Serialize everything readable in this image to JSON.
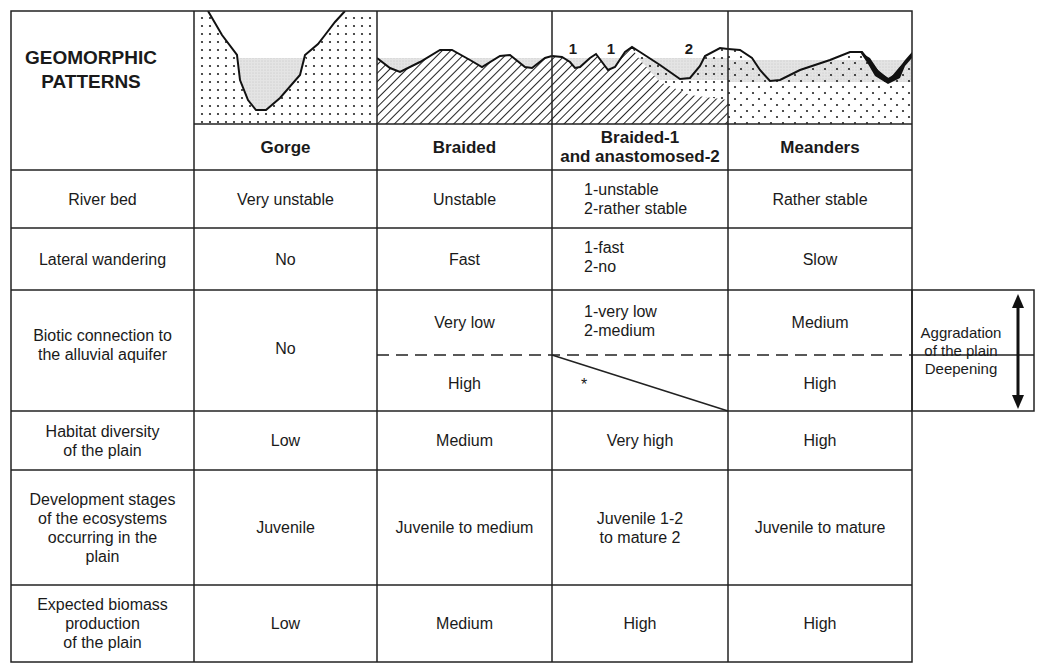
{
  "title": "GEOMORPHIC\nPATTERNS",
  "columns": [
    {
      "label": "Gorge"
    },
    {
      "label": "Braided"
    },
    {
      "label": "Braided-1\nand anastomosed-2"
    },
    {
      "label": "Meanders"
    }
  ],
  "diagram_labels": {
    "braid_1a": "1",
    "braid_1b": "1",
    "anast_2": "2"
  },
  "rows": {
    "river_bed": {
      "label": "River bed",
      "gorge": "Very unstable",
      "braided": "Unstable",
      "mixed": "1-unstable\n2-rather stable",
      "meanders": "Rather stable"
    },
    "lateral": {
      "label": "Lateral wandering",
      "gorge": "No",
      "braided": "Fast",
      "mixed": "1-fast\n2-no",
      "meanders": "Slow"
    },
    "biotic": {
      "label": "Biotic connection to\nthe alluvial aquifer",
      "gorge": "No",
      "braided_top": "Very low",
      "braided_bottom": "High",
      "mixed_top": "1-very low\n2-medium",
      "mixed_bottom": "*",
      "meanders_top": "Medium",
      "meanders_bottom": "High"
    },
    "habitat": {
      "label": "Habitat diversity\nof the plain",
      "gorge": "Low",
      "braided": "Medium",
      "mixed": "Very high",
      "meanders": "High"
    },
    "development": {
      "label": "Development stages\nof the ecosystems\noccurring in the\nplain",
      "gorge": "Juvenile",
      "braided": "Juvenile to medium",
      "mixed": "Juvenile 1-2\nto mature 2",
      "meanders": "Juvenile to mature"
    },
    "biomass": {
      "label": "Expected biomass\nproduction\nof the plain",
      "gorge": "Low",
      "braided": "Medium",
      "mixed": "High",
      "meanders": "High"
    }
  },
  "side_note": {
    "text": "Aggradation\nof the plain\nDeepening",
    "arrow": "double-vertical-arrow"
  }
}
